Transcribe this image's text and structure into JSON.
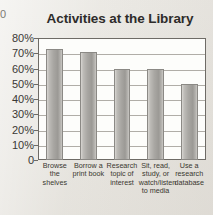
{
  "edge_artifact": {
    "glyph": "0"
  },
  "chart_data": {
    "type": "bar",
    "title": "Activities at the Library",
    "xlabel": "",
    "ylabel": "",
    "ylim": [
      0,
      80
    ],
    "grid": true,
    "legend": "none",
    "categories": [
      "Browse the shelves",
      "Borrow a print book",
      "Research topic of interest",
      "Sit, read, study, or watch/listen to media",
      "Use a research database"
    ],
    "category_lines": [
      [
        "Browse",
        "the",
        "shelves"
      ],
      [
        "Borrow a",
        "print book"
      ],
      [
        "Research",
        "topic of",
        "interest"
      ],
      [
        "Sit, read,",
        "study, or",
        "watch/listen",
        "to media"
      ],
      [
        "Use a",
        "research",
        "database"
      ]
    ],
    "values": [
      73,
      71,
      60,
      60,
      50
    ],
    "ytick_values": [
      80,
      70,
      60,
      50,
      40,
      30,
      20,
      10,
      0
    ],
    "ytick_labels": [
      "80%",
      "70%",
      "60%",
      "50%",
      "40%",
      "30%",
      "20%",
      "10%",
      "0"
    ],
    "bar_color": "#a9a7a3",
    "plot_background": "#fdfdfb",
    "axis_color": "#6e6b66",
    "grid_color": "#b0ada7",
    "title_color": "#2e2c2a",
    "page_background": "#e8e6e1"
  }
}
